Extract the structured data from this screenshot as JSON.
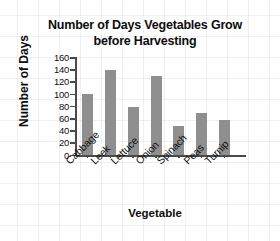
{
  "chart_data": {
    "type": "bar",
    "title": "Number of Days Vegetables Grow before Harvesting",
    "title_line_1": "Number of Days Vegetables Grow",
    "title_line_2": "before Harvesting",
    "xlabel": "Vegetable",
    "ylabel": "Number of Days",
    "categories": [
      "Cabbage",
      "Leek",
      "Lettuce",
      "Onion",
      "Spinach",
      "Peas",
      "Turnip"
    ],
    "values": [
      100,
      140,
      80,
      130,
      48,
      70,
      58
    ],
    "ylim": [
      0,
      160
    ],
    "ytick_values": [
      160,
      140,
      120,
      100,
      80,
      60,
      40,
      20,
      0
    ],
    "ytick_labels": [
      "160",
      "140",
      "120",
      "100",
      "80",
      "60",
      "40",
      "20",
      "0"
    ],
    "grid": false,
    "legend": "none",
    "bar_color": "#8f8f8f",
    "axis_color": "#4a4a4a",
    "background_color": "#ffffff"
  }
}
